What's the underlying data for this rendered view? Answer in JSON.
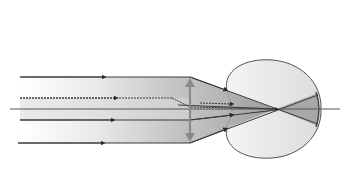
{
  "diagram": {
    "type": "optics-ray-diagram",
    "colors": {
      "background": "#ffffff",
      "ray": "#3a3a3a",
      "beam_fill_light": "#e6e6e6",
      "beam_fill_dark": "#a8a8a8",
      "eye_fill": "#eeeeee",
      "eye_outline": "#555555",
      "lens": "#8a8a8a",
      "axis": "#555555"
    },
    "elements": {
      "incident_rays": 4,
      "optical_axis": true,
      "lens": "converging lens (double-arrow symbol)",
      "eye": "eyeball cross-section with cornea bulge",
      "focal_point": "inside eye, before retina"
    }
  }
}
